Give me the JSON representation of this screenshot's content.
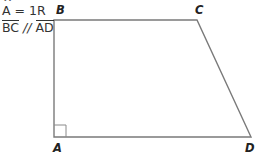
{
  "given": {
    "angle_vertex": "A",
    "hat": "^",
    "angle_eq": "= 1R",
    "seg1": "BC",
    "parallel": "//",
    "seg2": "AD"
  },
  "vertices": {
    "A": {
      "label": "A",
      "x": 54,
      "y": 137
    },
    "B": {
      "label": "B",
      "x": 54,
      "y": 20
    },
    "C": {
      "label": "C",
      "x": 197,
      "y": 20
    },
    "D": {
      "label": "D",
      "x": 251,
      "y": 137
    }
  },
  "colors": {
    "stroke": "#7a7a7a",
    "text": "#222222"
  }
}
